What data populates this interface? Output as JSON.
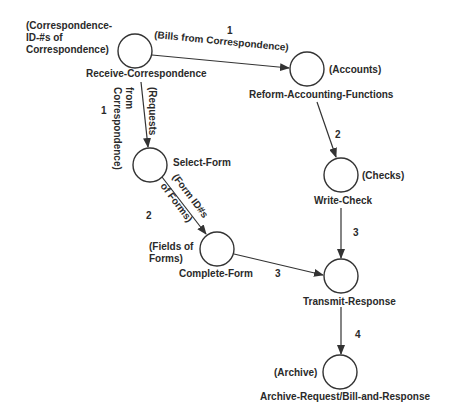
{
  "diagram": {
    "type": "process-flow",
    "nodes": [
      {
        "id": "receive",
        "label": "Receive-Correspondence",
        "data": [
          "(Correspondence-",
          "ID-#s of",
          "Correspondence)"
        ]
      },
      {
        "id": "reform",
        "label": "Reform-Accounting-Functions",
        "data": [
          "(Accounts)"
        ]
      },
      {
        "id": "select",
        "label": "Select-Form",
        "data": []
      },
      {
        "id": "write",
        "label": "Write-Check",
        "data": [
          "(Checks)"
        ]
      },
      {
        "id": "complete",
        "label": "Complete-Form",
        "data": [
          "(Fields of",
          "Forms)"
        ]
      },
      {
        "id": "transmit",
        "label": "Transmit-Response",
        "data": []
      },
      {
        "id": "archive",
        "label": "Archive-Request/Bill-and-Response",
        "data": [
          "(Archive)"
        ]
      }
    ],
    "edges": [
      {
        "from": "receive",
        "to": "reform",
        "step": "1",
        "label": [
          "(Bills from Correspondence)"
        ]
      },
      {
        "from": "receive",
        "to": "select",
        "step": "1",
        "label": [
          "(Requests",
          "from",
          "Correspondence)"
        ]
      },
      {
        "from": "reform",
        "to": "write",
        "step": "2",
        "label": []
      },
      {
        "from": "select",
        "to": "complete",
        "step": "2",
        "label": [
          "(Form ID#s",
          "of Forms)"
        ]
      },
      {
        "from": "write",
        "to": "transmit",
        "step": "3",
        "label": []
      },
      {
        "from": "complete",
        "to": "transmit",
        "step": "3",
        "label": []
      },
      {
        "from": "transmit",
        "to": "archive",
        "step": "4",
        "label": []
      }
    ]
  }
}
